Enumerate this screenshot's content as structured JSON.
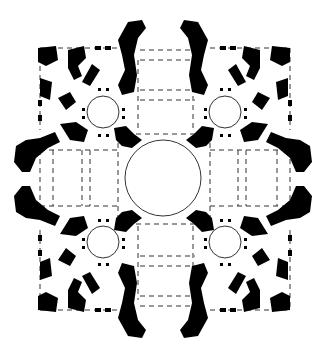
{
  "diagram": {
    "type": "architectural-floor-plan",
    "description": "Centrally planned Greek-cross church plan: large central dome, four corner chapels with smaller domes, four apsidal arms",
    "colors": {
      "background": "#ffffff",
      "wall_fill": "#000000",
      "line": "#333333"
    },
    "elements": {
      "central_dome": {
        "cx": 163,
        "cy": 178,
        "r": 38
      },
      "corner_domes": [
        {
          "name": "northwest",
          "cx": 103,
          "cy": 112,
          "r": 16
        },
        {
          "name": "northeast",
          "cx": 225,
          "cy": 112,
          "r": 16
        },
        {
          "name": "southwest",
          "cx": 103,
          "cy": 242,
          "r": 16
        },
        {
          "name": "southeast",
          "cx": 225,
          "cy": 242,
          "r": 16
        }
      ],
      "apses": [
        "north",
        "south",
        "east",
        "west"
      ]
    }
  }
}
